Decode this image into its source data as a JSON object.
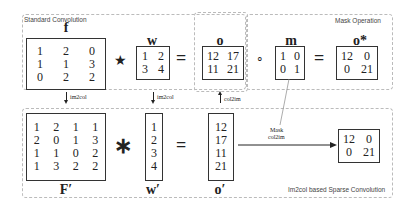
{
  "top_box": {
    "caption": "Standard Convolution"
  },
  "mask_box": {
    "caption": "Mask Operation"
  },
  "bottom_box": {
    "caption": "Im2col based Sparse Convolution"
  },
  "labels": {
    "f": "f",
    "w": "w",
    "o": "o",
    "m": "m",
    "o_star": "o*",
    "F_prime": "F′",
    "w_prime": "w′",
    "o_prime": "o′"
  },
  "operators": {
    "conv": "★",
    "equals": "=",
    "hadamard": "∘",
    "mult": "∗"
  },
  "arrows": {
    "im2col_1": "im2col",
    "im2col_2": "im2col",
    "col2im": "col2im",
    "mask_line1": "Mask",
    "mask_line2": "col2im"
  },
  "matrices": {
    "f": [
      [
        "1",
        "2",
        "0"
      ],
      [
        "1",
        "1",
        "3"
      ],
      [
        "0",
        "2",
        "2"
      ]
    ],
    "w": [
      [
        "1",
        "2"
      ],
      [
        "3",
        "4"
      ]
    ],
    "o": [
      [
        "12",
        "17"
      ],
      [
        "11",
        "21"
      ]
    ],
    "m": [
      [
        "1",
        "0"
      ],
      [
        "0",
        "1"
      ]
    ],
    "o_star": [
      [
        "12",
        "0"
      ],
      [
        "0",
        "21"
      ]
    ],
    "F_prime": [
      [
        "1",
        "2",
        "1",
        "1"
      ],
      [
        "2",
        "0",
        "1",
        "3"
      ],
      [
        "1",
        "1",
        "0",
        "2"
      ],
      [
        "1",
        "3",
        "2",
        "2"
      ]
    ],
    "w_prime": [
      [
        "1"
      ],
      [
        "2"
      ],
      [
        "3"
      ],
      [
        "4"
      ]
    ],
    "o_prime": [
      [
        "12"
      ],
      [
        "17"
      ],
      [
        "11"
      ],
      [
        "21"
      ]
    ],
    "result": [
      [
        "12",
        "0"
      ],
      [
        "0",
        "21"
      ]
    ]
  }
}
